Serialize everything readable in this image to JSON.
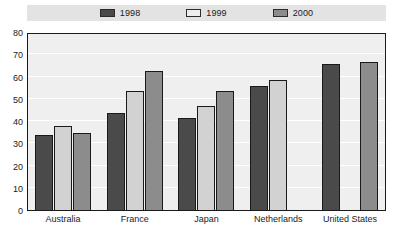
{
  "chart_data": {
    "type": "bar",
    "title": "",
    "xlabel": "",
    "ylabel": "",
    "ylim": [
      0,
      80
    ],
    "ytick_step": 10,
    "yticks": [
      0,
      10,
      20,
      30,
      40,
      50,
      60,
      70,
      80
    ],
    "grid": true,
    "legend_position": "top-center",
    "categories": [
      "Australia",
      "France",
      "Japan",
      "Netherlands",
      "United States"
    ],
    "series": [
      {
        "name": "1998",
        "color": "#4a4a4a",
        "values": [
          34,
          44,
          42,
          56,
          66
        ]
      },
      {
        "name": "1999",
        "color": "#d2d2d2",
        "values": [
          38,
          54,
          47,
          59,
          null
        ]
      },
      {
        "name": "2000",
        "color": "#8c8c8c",
        "values": [
          35,
          63,
          54,
          null,
          67
        ]
      }
    ]
  },
  "legend": {
    "items": [
      {
        "label": "1998",
        "swatch": "legend-swatch-1998"
      },
      {
        "label": "1999",
        "swatch": "legend-swatch-1999"
      },
      {
        "label": "2000",
        "swatch": "legend-swatch-2000"
      }
    ]
  },
  "axis": {
    "y_labels": [
      "80",
      "70",
      "60",
      "50",
      "40",
      "30",
      "20",
      "10",
      "0"
    ]
  },
  "colors": {
    "series_1998": "#4a4a4a",
    "series_1999": "#d2d2d2",
    "series_2000": "#8c8c8c",
    "plot_background": "#efefef",
    "legend_background": "#e3e3e3",
    "axis_line": "#1a1a1a",
    "gridline": "#ffffff"
  }
}
